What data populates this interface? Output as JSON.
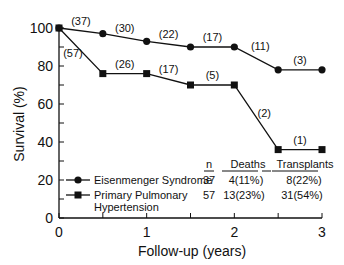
{
  "chart_data": {
    "type": "line",
    "title": "",
    "xlabel": "Follow-up (years)",
    "ylabel": "Survival (%)",
    "xlim": [
      0,
      3
    ],
    "ylim": [
      0,
      100
    ],
    "x_ticks": [
      "0",
      "1",
      "2",
      "3"
    ],
    "y_ticks": [
      "0",
      "20",
      "40",
      "60",
      "80",
      "100"
    ],
    "grid": false,
    "legend_position": "lower-left",
    "x": [
      0,
      0.5,
      1,
      1.5,
      2,
      2.5,
      3
    ],
    "series": [
      {
        "name": "Eisenmenger Syndrome",
        "marker": "circle",
        "values": [
          100,
          97,
          93,
          90,
          90,
          78,
          78
        ],
        "at_risk_labels": [
          "(37)",
          "(30)",
          "(22)",
          "(17)",
          "(11)",
          "(3)"
        ]
      },
      {
        "name": "Primary Pulmonary Hypertension",
        "marker": "square",
        "values": [
          100,
          76,
          76,
          70,
          70,
          36,
          36
        ],
        "at_risk_labels": [
          "(57)",
          "(26)",
          "(17)",
          "(5)",
          "(2)",
          "(1)"
        ]
      }
    ],
    "table": {
      "headers": [
        "n",
        "Deaths",
        "Transplants"
      ],
      "rows": [
        {
          "group": "Eisenmenger Syndrome",
          "n": "37",
          "deaths": "4(11%)",
          "transplants": "8(22%)"
        },
        {
          "group": "Primary Pulmonary Hypertension",
          "n": "57",
          "deaths": "13(23%)",
          "transplants": "31(54%)"
        }
      ]
    }
  },
  "legend": {
    "eis_label": "Eisenmenger Syndrome",
    "pph_label_1": "Primary Pulmonary",
    "pph_label_2": "Hypertension"
  }
}
